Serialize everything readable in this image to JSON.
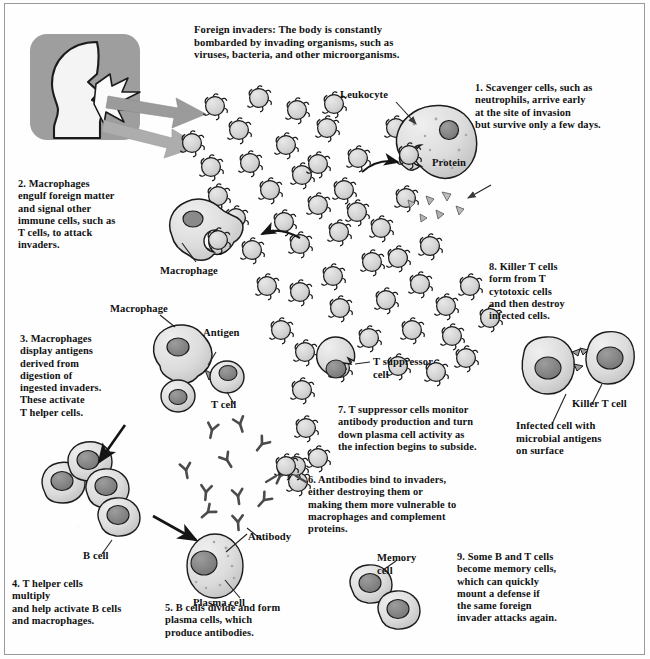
{
  "diagram": {
    "colors": {
      "cell_fill": "#cfcfcf",
      "cell_fill_light": "#e2e2e2",
      "nucleus": "#8d8d8d",
      "nucleus_dark": "#777777",
      "outline": "#1a1a1a",
      "arrow_gray": "#9b9b9b",
      "panel_gray": "#9e9e9e",
      "head_fill": "#f2f2f2",
      "text": "#111111",
      "border": "#9a9a9a"
    }
  },
  "header": {
    "invaders_note": "Foreign invaders: The body is constantly\nbombarded by invading organisms, such as\nviruses, bacteria, and other microorganisms."
  },
  "steps": [
    {
      "id": "step-1",
      "number": "1.",
      "text": "1. Scavenger cells, such as\nneutrophils, arrive early\nat the site of invasion\nbut survive only a few days."
    },
    {
      "id": "step-2",
      "number": "2.",
      "text": "2. Macrophages\nengulf foreign matter\nand signal other\nimmune cells, such as\nT cells, to attack\ninvaders."
    },
    {
      "id": "step-3",
      "number": "3.",
      "text": "3. Macrophages\ndisplay antigens\nderived from\ndigestion of\ningested invaders.\nThese activate\nT helper cells."
    },
    {
      "id": "step-4",
      "number": "4.",
      "text": "4. T helper cells\nmultiply\nand help activate B cells\nand macrophages."
    },
    {
      "id": "step-5",
      "number": "5.",
      "text": "5. B cells divide and form\nplasma cells, which\nproduce antibodies."
    },
    {
      "id": "step-6",
      "number": "6.",
      "text": "6. Antibodies bind to invaders,\neither destroying them or\nmaking them more vulnerable to\nmacrophages and complement\nproteins."
    },
    {
      "id": "step-7",
      "number": "7.",
      "text": "7. T suppressor cells monitor\nantibody production and turn\ndown plasma cell activity as\nthe infection begins to subside."
    },
    {
      "id": "step-8",
      "number": "8.",
      "text": "8. Killer T cells\nform from T\ncytotoxic cells\nand then destroy\ninfected cells."
    },
    {
      "id": "step-9",
      "number": "9.",
      "text": "9. Some B and T cells\nbecome memory cells,\nwhich can quickly\nmount a defense if\nthe same foreign\ninvader attacks again."
    }
  ],
  "labels": {
    "leukocyte": "Leukocyte",
    "protein": "Protein",
    "macrophage_top": "Macrophage",
    "macrophage_mid": "Macrophage",
    "antigen": "Antigen",
    "t_cell": "T cell",
    "t_suppressor_cell": "T suppressor\ncell",
    "killer_t_cell": "Killer T cell",
    "infected_cell": "Infected cell with\nmicrobial antigens\non surface",
    "b_cell": "B cell",
    "antibody": "Antibody",
    "plasma_cell": "Plasma cell",
    "memory_cell": "Memory\ncell"
  }
}
